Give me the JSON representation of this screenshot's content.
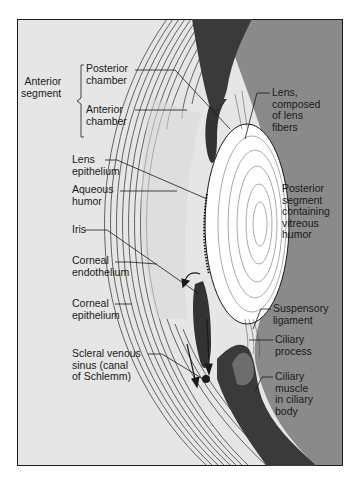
{
  "page": {
    "top_caption": "(fragment of preceding text line, cut off)",
    "bottom_caption": "(fragment of following text line, cut off)"
  },
  "figure": {
    "colors": {
      "background": "#e6e6e6",
      "vitreous": "#8a8a8a",
      "sclera_lines": "#2a2a2a",
      "label_text": "#1a1a1a",
      "frame": "#1a1a1a"
    },
    "group_label": {
      "text": "Anterior\nsegment",
      "members": [
        "Posterior chamber",
        "Anterior chamber"
      ]
    },
    "labels_left": [
      {
        "id": "posterior-chamber",
        "text": "Posterior\nchamber"
      },
      {
        "id": "anterior-chamber",
        "text": "Anterior\nchamber"
      },
      {
        "id": "lens-epithelium",
        "text": "Lens\nepithelium"
      },
      {
        "id": "aqueous-humor",
        "text": "Aqueous\nhumor"
      },
      {
        "id": "iris",
        "text": "Iris"
      },
      {
        "id": "corneal-endothelium",
        "text": "Corneal\nendothelium"
      },
      {
        "id": "corneal-epithelium",
        "text": "Corneal\nepithelium"
      },
      {
        "id": "scleral-venous-sinus",
        "text": "Scleral venous\nsinus (canal\nof Schlemm)"
      }
    ],
    "labels_right": [
      {
        "id": "lens",
        "text": "Lens,\ncomposed\nof lens\nfibers"
      },
      {
        "id": "posterior-segment",
        "text": "Posterior\nsegment\ncontaining\nvitreous\nhumor"
      },
      {
        "id": "suspensory-ligament",
        "text": "Suspensory\nligament"
      },
      {
        "id": "ciliary-process",
        "text": "Ciliary\nprocess"
      },
      {
        "id": "ciliary-muscle",
        "text": "Ciliary\nmuscle\nin ciliary\nbody"
      }
    ]
  }
}
